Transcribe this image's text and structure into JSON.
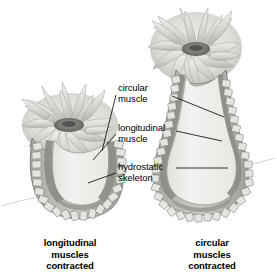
{
  "figure": {
    "background_color": "#ffffff",
    "ink_color": "#000000"
  },
  "callouts": [
    {
      "id": "circular-muscle",
      "label": "circular\nmuscle",
      "leader_targets": [
        "left-anemone-body-wall",
        "right-anemone-body-wall"
      ]
    },
    {
      "id": "longitudinal-muscle",
      "label": "longitudinal\nmuscle",
      "leader_targets": [
        "left-anemone-body-wall",
        "right-anemone-body-wall"
      ]
    },
    {
      "id": "hydrostatic-skeleton",
      "label": "hydrostatic\nskeleton",
      "leader_targets": [
        "left-anemone-cavity",
        "right-anemone-cavity"
      ]
    }
  ],
  "specimens": [
    {
      "id": "left-anemone",
      "caption": "longitudinal\nmuscles\ncontracted",
      "form": "short-and-wide",
      "state": "longitudinal muscles contracted"
    },
    {
      "id": "right-anemone",
      "caption": "circular\nmuscles\ncontracted",
      "form": "tall-and-narrow",
      "state": "circular muscles contracted"
    }
  ],
  "colors": {
    "cavity_fill": "#eeeeec",
    "body_wall_light": "#d8d8d4",
    "body_wall_mid": "#bdbdb8",
    "muscle_dark": "#8c8c87",
    "oral_disc": "#6a6a68",
    "tentacle_light": "#e3e3df",
    "tentacle_mid": "#c6c6c1",
    "outline": "#6f6f6c",
    "substrate_line": "#cfcfcb",
    "text": "#000000"
  }
}
